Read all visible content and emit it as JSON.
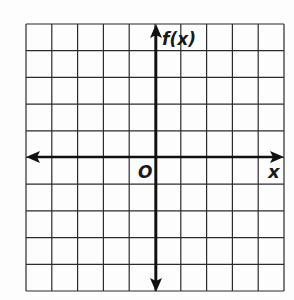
{
  "diagram": {
    "type": "coordinate-plane",
    "grid": {
      "columns": 10,
      "rows": 10,
      "line_color": "#2b2b2b",
      "background": "#fdfdfd"
    },
    "axes": {
      "x_label": "x",
      "y_label": "f(x)",
      "origin_label": "O",
      "color": "#111111"
    }
  }
}
